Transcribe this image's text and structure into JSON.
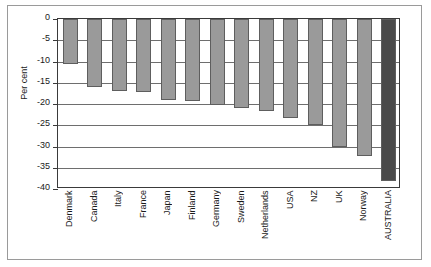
{
  "chart_data": {
    "type": "bar",
    "title": "",
    "subtitle": "",
    "xlabel": "",
    "ylabel": "Per cent",
    "ylim": [
      -40,
      0
    ],
    "ytick_step": 5,
    "yticks": [
      "0",
      "-5",
      "-10",
      "-15",
      "-20",
      "-25",
      "-30",
      "-35",
      "-40"
    ],
    "ytick_values": [
      0,
      -5,
      -10,
      -15,
      -20,
      -25,
      -30,
      -35,
      -40
    ],
    "grid": true,
    "legend": "none",
    "categories": [
      "Denmark",
      "Canada",
      "Italy",
      "France",
      "Japan",
      "Finland",
      "Germany",
      "Sweden",
      "Netherlands",
      "USA",
      "NZ",
      "UK",
      "Norway",
      "AUSTRALIA"
    ],
    "values": [
      -10.7,
      -16.0,
      -16.9,
      -17.2,
      -19.1,
      -19.3,
      -20.2,
      -21.0,
      -21.6,
      -23.2,
      -25.0,
      -30.0,
      -32.2,
      -38.1
    ],
    "bar_colors": [
      "#9a9a9a",
      "#9a9a9a",
      "#9a9a9a",
      "#9a9a9a",
      "#9a9a9a",
      "#9a9a9a",
      "#9a9a9a",
      "#9a9a9a",
      "#9a9a9a",
      "#9a9a9a",
      "#9a9a9a",
      "#9a9a9a",
      "#9a9a9a",
      "#4a4a4a"
    ],
    "highlight_category": "AUSTRALIA",
    "colors": {
      "bar_default": "#9a9a9a",
      "bar_highlight": "#4a4a4a",
      "bar_edge": "#5e5e5e",
      "gridline": "#6e6e6e",
      "axis": "#3a3a3a",
      "frame": "#9a9a9a",
      "text": "#1a1a1a",
      "background": "#ffffff"
    }
  }
}
